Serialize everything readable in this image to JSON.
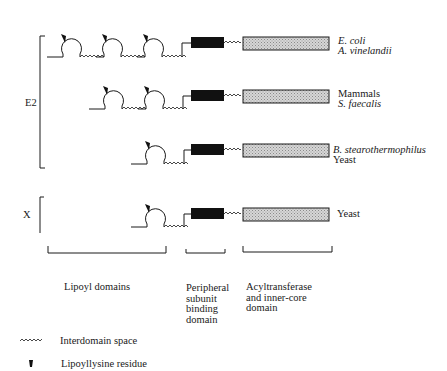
{
  "diagram": {
    "colors": {
      "ink": "#1a1a1a",
      "binding_domain": "#111111",
      "core_domain": "#c8c8c8"
    },
    "groups": [
      {
        "label": "E2"
      },
      {
        "label": "X"
      }
    ],
    "rows": [
      {
        "lipoyl_domains": 3,
        "organisms": [
          {
            "name": "E. coli",
            "italic": true
          },
          {
            "name": "A. vinelandii",
            "italic": true
          }
        ]
      },
      {
        "lipoyl_domains": 2,
        "organisms": [
          {
            "name": "Mammals",
            "italic": false
          },
          {
            "name": "S. faecalis",
            "italic": true
          }
        ]
      },
      {
        "lipoyl_domains": 1,
        "organisms": [
          {
            "name": "B. stearothermophilus",
            "italic": true
          },
          {
            "name": "Yeast",
            "italic": false
          }
        ]
      },
      {
        "lipoyl_domains": 1,
        "organisms": [
          {
            "name": "Yeast",
            "italic": false
          }
        ]
      }
    ],
    "domain_labels": {
      "lipoyl": "Lipoyl domains",
      "peripheral": [
        "Peripheral",
        "subunit",
        "binding",
        "domain"
      ],
      "acyl": [
        "Acyltransferase",
        "and inner-core",
        "domain"
      ]
    },
    "legend": [
      {
        "icon": "wavy-line-icon",
        "label": "Interdomain space"
      },
      {
        "icon": "wedge-icon",
        "label": "Lipoyllysine residue"
      }
    ]
  }
}
